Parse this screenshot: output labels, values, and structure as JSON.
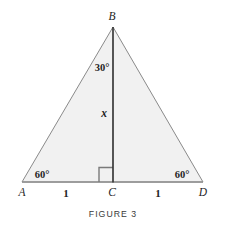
{
  "figure": {
    "caption": "FIGURE 3",
    "shape_type": "triangle",
    "fill_color": "#f1f1f1",
    "outline_color": "#8a8a8a",
    "altitude_color": "#3a3a3a",
    "vertices": [
      {
        "name": "B",
        "label": "B",
        "x": 113,
        "y": 27,
        "label_x": 112,
        "label_y": 17
      },
      {
        "name": "A",
        "label": "A",
        "x": 22,
        "y": 182,
        "label_x": 22,
        "label_y": 193
      },
      {
        "name": "C",
        "label": "C",
        "x": 113,
        "y": 182,
        "label_x": 112,
        "label_y": 193
      },
      {
        "name": "D",
        "label": "D",
        "x": 203,
        "y": 182,
        "label_x": 203,
        "label_y": 193
      }
    ],
    "angles": [
      {
        "name": "angle-abc",
        "label": "30°",
        "x": 102,
        "y": 68,
        "value": 30
      },
      {
        "name": "angle-bad",
        "label": "60°",
        "x": 42,
        "y": 175,
        "value": 60
      },
      {
        "name": "angle-bda",
        "label": "60°",
        "x": 182,
        "y": 175,
        "value": 60
      }
    ],
    "segments": [
      {
        "name": "segment-ac",
        "label": "1",
        "x": 66,
        "y": 193,
        "value": 1
      },
      {
        "name": "segment-cd",
        "label": "1",
        "x": 158,
        "y": 193,
        "value": 1
      },
      {
        "name": "segment-bc",
        "label": "x",
        "x": 104,
        "y": 114,
        "value": "x"
      }
    ],
    "right_angle_marker": {
      "name": "right-angle-marker",
      "x": 99,
      "y": 167,
      "size": 14,
      "at_vertex": "C"
    }
  }
}
